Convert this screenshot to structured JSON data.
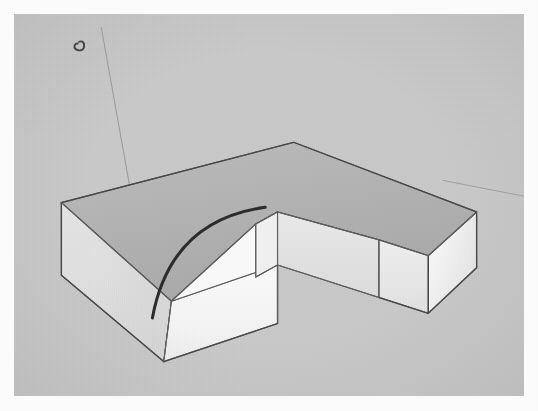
{
  "app": {
    "title": "3D Modeling Viewport",
    "kind": "sketchup-style-3d-view",
    "frame_label": "Photographed screen capture of a 3D modeling viewport"
  },
  "viewport": {
    "name": "3d-viewport",
    "background_color": "#c9c9c9",
    "frame_border_color": "#fdfdfd",
    "width": 510,
    "height": 382,
    "x": 14,
    "y": 14
  },
  "colors": {
    "background": "#c9c9c9",
    "top_face": "#b4b4b4",
    "top_face_shade": "#adadad",
    "front_face": "#f7f7f7",
    "right_face": "#ededed",
    "left_face": "#e1e1e1",
    "inner_wall_left": "#f2f2f2",
    "inner_wall_right": "#e6e6e6",
    "inner_floor": "#bfbfbf",
    "edge": "#4a4a4a",
    "edge_soft": "#8a8a8a",
    "axis_line": "#9a9a9a",
    "arc_stroke": "#2b2b2b",
    "marker": "#3a3a3a"
  },
  "geometry": {
    "name": "l-shaped-extruded-solid",
    "description": "L / U shaped extruded slab with a rectangular notch cut from the front-right",
    "top_face_points": "50,203 295,138 488,213 385,243 298,213 255,226 255,283 166,309",
    "front_left_face_points": "50,203 50,281 158,374 166,309",
    "front_face_points": "166,309 158,374 278,333 278,270",
    "notch_left_wall_points": "255,226 255,283 278,270 278,213",
    "notch_right_wall_points": "278,270 278,213 385,243 385,305",
    "right_arm_front_points": "385,305 385,243 488,213 488,273",
    "right_arm_end_points": "437,322 385,305 385,243 437,260",
    "left_side_face_points": "50,203 166,309 255,283 255,226",
    "edges": [
      {
        "name": "top-back-left",
        "from": [
          50,
          203
        ],
        "to": [
          295,
          138
        ]
      },
      {
        "name": "top-back-right",
        "from": [
          295,
          138
        ],
        "to": [
          488,
          213
        ]
      },
      {
        "name": "top-right-arm-front",
        "from": [
          488,
          213
        ],
        "to": [
          385,
          243
        ]
      },
      {
        "name": "notch-inner-back",
        "from": [
          385,
          243
        ],
        "to": [
          278,
          213
        ]
      },
      {
        "name": "notch-inner-left",
        "from": [
          278,
          213
        ],
        "to": [
          255,
          226
        ]
      },
      {
        "name": "top-front-left-wing",
        "from": [
          255,
          226
        ],
        "to": [
          166,
          309
        ]
      },
      {
        "name": "top-left-edge",
        "from": [
          50,
          203
        ],
        "to": [
          166,
          309
        ]
      },
      {
        "name": "vertical-left-corner",
        "from": [
          50,
          203
        ],
        "to": [
          50,
          281
        ]
      },
      {
        "name": "vertical-front-left",
        "from": [
          166,
          309
        ],
        "to": [
          158,
          374
        ]
      },
      {
        "name": "bottom-front-left",
        "from": [
          50,
          281
        ],
        "to": [
          158,
          374
        ]
      },
      {
        "name": "front-bottom",
        "from": [
          158,
          374
        ],
        "to": [
          278,
          333
        ]
      },
      {
        "name": "front-right-vertical",
        "from": [
          278,
          270
        ],
        "to": [
          278,
          333
        ]
      },
      {
        "name": "wing-top-front",
        "from": [
          166,
          309
        ],
        "to": [
          278,
          270
        ]
      },
      {
        "name": "notch-vertical-left",
        "from": [
          255,
          226
        ],
        "to": [
          255,
          283
        ]
      },
      {
        "name": "notch-floor-left",
        "from": [
          255,
          283
        ],
        "to": [
          278,
          270
        ]
      },
      {
        "name": "notch-vertical-mid",
        "from": [
          278,
          213
        ],
        "to": [
          278,
          270
        ]
      },
      {
        "name": "notch-floor-right",
        "from": [
          278,
          270
        ],
        "to": [
          385,
          305
        ]
      },
      {
        "name": "notch-vertical-right",
        "from": [
          385,
          243
        ],
        "to": [
          385,
          305
        ]
      },
      {
        "name": "right-arm-bottom-front",
        "from": [
          385,
          305
        ],
        "to": [
          437,
          322
        ]
      },
      {
        "name": "right-arm-end-vertical",
        "from": [
          437,
          260
        ],
        "to": [
          437,
          322
        ]
      },
      {
        "name": "right-arm-top-end",
        "from": [
          437,
          260
        ],
        "to": [
          488,
          213
        ]
      },
      {
        "name": "right-arm-end-back",
        "from": [
          488,
          213
        ],
        "to": [
          488,
          273
        ]
      }
    ]
  },
  "arc": {
    "name": "arc-preview",
    "description": "Dark curved arc drawn across the front-left block face",
    "start": [
      146,
      327
    ],
    "end": [
      265,
      208
    ],
    "control": [
      165,
      222
    ],
    "stroke_color": "#2b2b2b",
    "stroke_width": 3.2
  },
  "axes": {
    "blue_axis": {
      "name": "blue-axis-line",
      "from": [
        92,
        20
      ],
      "to": [
        146,
        330
      ],
      "color": "#9a9a9a"
    },
    "green_axis": {
      "name": "green-axis-line",
      "from": [
        455,
        180
      ],
      "to": [
        538,
        196
      ],
      "color": "#a0a0a0"
    }
  },
  "marker": {
    "name": "endpoint-marker",
    "description": "Small dark curl / inference marker near top-left of viewport",
    "x": 71,
    "y": 34,
    "color": "#3a3a3a"
  }
}
